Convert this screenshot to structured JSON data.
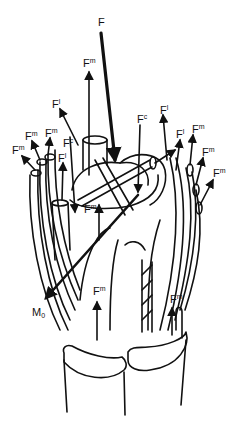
{
  "diagram": {
    "labels": [
      {
        "id": "F_total",
        "base": "F",
        "sup": "",
        "sub": "",
        "x": 98,
        "y": 17
      },
      {
        "id": "Fm_top",
        "base": "F",
        "sup": "m",
        "sub": "",
        "x": 83,
        "y": 57
      },
      {
        "id": "Fl_left_upper",
        "base": "F",
        "sup": "l",
        "sub": "",
        "x": 52,
        "y": 98
      },
      {
        "id": "Fc_right",
        "base": "F",
        "sup": "c",
        "sub": "",
        "x": 137,
        "y": 113
      },
      {
        "id": "Fl_right_upper",
        "base": "F",
        "sup": "l",
        "sub": "",
        "x": 160,
        "y": 104
      },
      {
        "id": "Fl_right_mid",
        "base": "F",
        "sup": "l",
        "sub": "",
        "x": 176,
        "y": 128
      },
      {
        "id": "Fm_right_1",
        "base": "F",
        "sup": "m",
        "sub": "",
        "x": 192,
        "y": 123
      },
      {
        "id": "Fm_left_1",
        "base": "F",
        "sup": "m",
        "sub": "",
        "x": 25,
        "y": 130
      },
      {
        "id": "Fm_left_2",
        "base": "F",
        "sup": "m",
        "sub": "",
        "x": 45,
        "y": 127
      },
      {
        "id": "Fc_left",
        "base": "F",
        "sup": "c",
        "sub": "",
        "x": 63,
        "y": 137
      },
      {
        "id": "Fm_left_3",
        "base": "F",
        "sup": "m",
        "sub": "",
        "x": 12,
        "y": 144
      },
      {
        "id": "Fl_left_mid",
        "base": "F",
        "sup": "l",
        "sub": "",
        "x": 58,
        "y": 152
      },
      {
        "id": "Fm_right_2",
        "base": "F",
        "sup": "m",
        "sub": "",
        "x": 202,
        "y": 146
      },
      {
        "id": "Fm_right_3",
        "base": "F",
        "sup": "m",
        "sub": "",
        "x": 213,
        "y": 167
      },
      {
        "id": "Fm_center",
        "base": "F",
        "sup": "m",
        "sub": "",
        "x": 84,
        "y": 203
      },
      {
        "id": "M0",
        "base": "M",
        "sup": "",
        "sub": "0",
        "x": 32,
        "y": 307
      },
      {
        "id": "Fm_bottom_left",
        "base": "F",
        "sup": "m",
        "sub": "",
        "x": 93,
        "y": 285
      },
      {
        "id": "Fm_bottom_right",
        "base": "F",
        "sup": "m",
        "sub": "",
        "x": 170,
        "y": 293
      }
    ],
    "colors": {
      "stroke": "#111111",
      "background": "#ffffff"
    }
  }
}
